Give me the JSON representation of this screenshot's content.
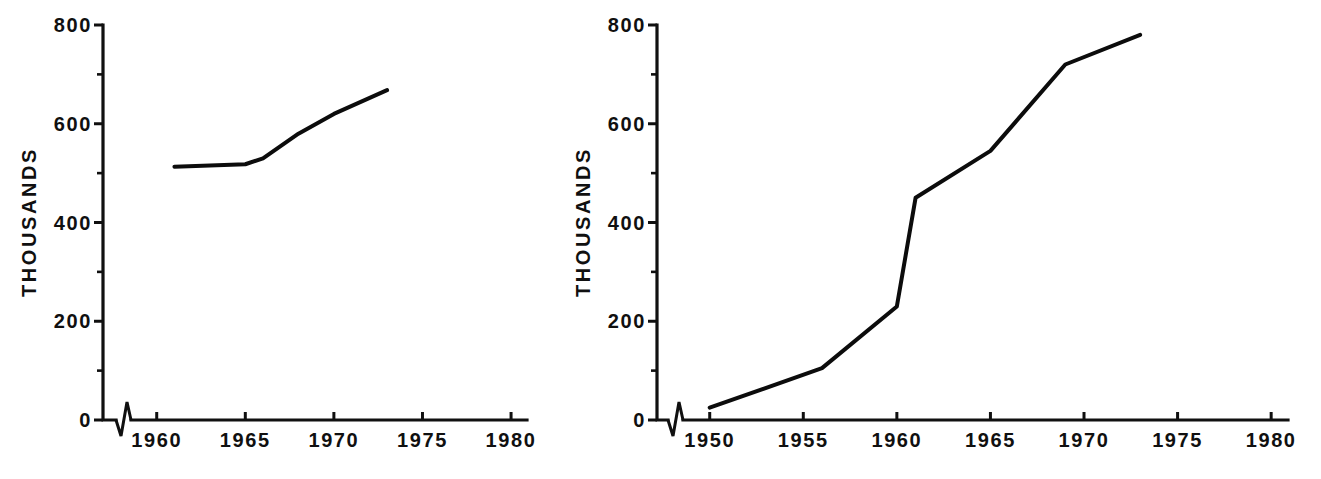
{
  "figure": {
    "background_color": "#ffffff",
    "line_color": "#0c0c0c",
    "text_color": "#101010",
    "panel_count": 2
  },
  "chart_data": [
    {
      "id": "left-chart",
      "type": "line",
      "title": "",
      "subtitle": "",
      "xlabel": "",
      "ylabel": "THOUSANDS",
      "xlim": [
        1958,
        1980
      ],
      "ylim": [
        0,
        800
      ],
      "grid": false,
      "legend": null,
      "legend_position": "none",
      "axis_break": true,
      "axis_break_note": "zigzag break on x-axis between origin and 1960",
      "x_ticks_major": [
        1960,
        1965,
        1970,
        1975,
        1980
      ],
      "x_tick_labels": [
        "1960",
        "1965",
        "1970",
        "1975",
        "1980"
      ],
      "y_ticks_major": [
        0,
        200,
        400,
        600,
        800
      ],
      "y_tick_labels": [
        "0",
        "200",
        "400",
        "600",
        "800"
      ],
      "y_ticks_minor": [
        100,
        300,
        500,
        700
      ],
      "series": [
        {
          "name": "series-1",
          "x": [
            1961,
            1965,
            1966,
            1968,
            1970,
            1973
          ],
          "values": [
            513,
            518,
            530,
            580,
            620,
            668
          ]
        }
      ]
    },
    {
      "id": "right-chart",
      "type": "line",
      "title": "",
      "subtitle": "",
      "xlabel": "",
      "ylabel": "THOUSANDS",
      "xlim": [
        1948,
        1980
      ],
      "ylim": [
        0,
        800
      ],
      "grid": false,
      "legend": null,
      "legend_position": "none",
      "axis_break": true,
      "axis_break_note": "zigzag break on x-axis between origin and 1950",
      "x_ticks_major": [
        1950,
        1955,
        1960,
        1965,
        1970,
        1975,
        1980
      ],
      "x_tick_labels": [
        "1950",
        "1955",
        "1960",
        "1965",
        "1970",
        "1975",
        "1980"
      ],
      "y_ticks_major": [
        0,
        200,
        400,
        600,
        800
      ],
      "y_tick_labels": [
        "0",
        "200",
        "400",
        "600",
        "800"
      ],
      "y_ticks_minor": [
        100,
        300,
        500,
        700
      ],
      "series": [
        {
          "name": "series-1",
          "x": [
            1950,
            1956,
            1960,
            1961,
            1965,
            1969,
            1973
          ],
          "values": [
            25,
            105,
            230,
            450,
            545,
            720,
            780
          ]
        }
      ]
    }
  ]
}
